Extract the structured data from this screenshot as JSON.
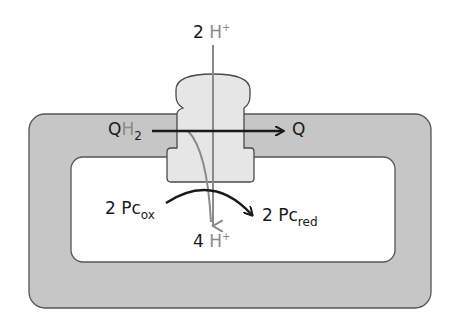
{
  "diagram": {
    "type": "cytochrome b6f complex electron/proton transfer in thylakoid membrane",
    "colors": {
      "membrane_fill": "#c6c6c6",
      "membrane_stroke": "#555555",
      "lumen_fill": "#ffffff",
      "protein_fill": "#e6e6e6",
      "proton_arrow": "#8a8a8a",
      "electron_arrow": "#1a1a1a"
    },
    "labels": {
      "top_proton": {
        "coef": "2",
        "species": "H",
        "charge": "+"
      },
      "bottom_proton": {
        "coef": "4",
        "species": "H",
        "charge": "+"
      },
      "qh2": {
        "main": "Q",
        "h": "H",
        "sub": "2"
      },
      "q": "Q",
      "pc_ox": {
        "coef": "2",
        "main": "Pc",
        "sub": "ox"
      },
      "pc_red": {
        "coef": "2",
        "main": "Pc",
        "sub": "red"
      }
    }
  }
}
